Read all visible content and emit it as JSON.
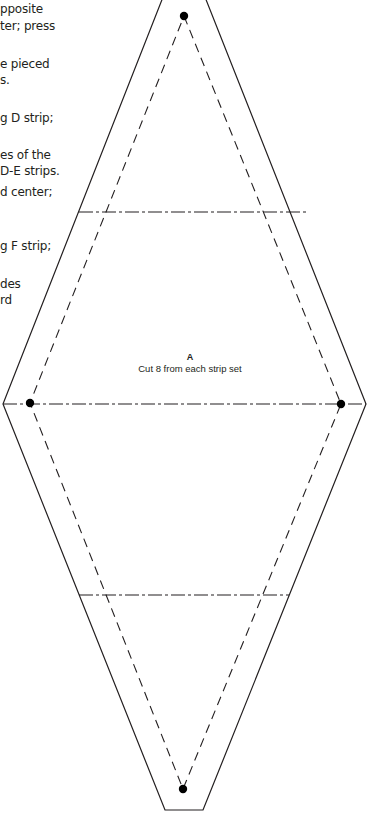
{
  "instructions": {
    "lines": [
      {
        "text": "pposite",
        "top": 2
      },
      {
        "text": "ter; press",
        "top": 19
      },
      {
        "text": "e pieced",
        "top": 57
      },
      {
        "text": "s.",
        "top": 73
      },
      {
        "text": "g D strip;",
        "top": 111
      },
      {
        "text": "es of the",
        "top": 148
      },
      {
        "text": "D-E strips.",
        "top": 164
      },
      {
        "text": "d center;",
        "top": 185
      },
      {
        "text": "g F strip;",
        "top": 239
      },
      {
        "text": "des",
        "top": 277
      },
      {
        "text": "rd",
        "top": 293
      }
    ]
  },
  "pattern": {
    "piece_letter": "A",
    "cut_instruction": "Cut 8 from each strip set",
    "line_color": "#231f20",
    "outer_outline": "seam allowance cut line (solid)",
    "inner_outline": "sewing line (dashed)",
    "grain_lines": "dash-dot strip seam guides",
    "registration_dots": 4
  }
}
